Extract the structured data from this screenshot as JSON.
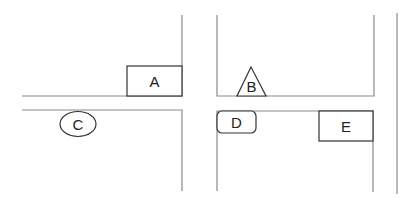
{
  "diagram": {
    "type": "street-map-sketch",
    "colors": {
      "road": "#8a8a8a",
      "shape_stroke": "#333333",
      "label": "#222222",
      "background": "#ffffff"
    },
    "landmarks": [
      {
        "id": "A",
        "label": "A",
        "shape": "rectangle"
      },
      {
        "id": "B",
        "label": "B",
        "shape": "triangle"
      },
      {
        "id": "C",
        "label": "C",
        "shape": "ellipse"
      },
      {
        "id": "D",
        "label": "D",
        "shape": "rounded-rectangle"
      },
      {
        "id": "E",
        "label": "E",
        "shape": "rectangle"
      }
    ]
  }
}
